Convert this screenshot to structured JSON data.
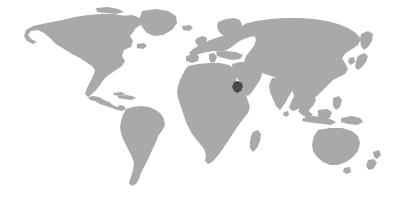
{
  "figure": {
    "kind": "world-locator-map",
    "width": 415,
    "height": 200,
    "projection": "equirectangular"
  },
  "colors": {
    "background": "#ffffff",
    "land": "#a9a9a9",
    "highlight": "#4a4a4a"
  },
  "map": {
    "land_label": "World landmasses",
    "highlight_label": "Highlighted country",
    "highlight_region": "Arabian Peninsula",
    "highlight_center_x": 238,
    "highlight_center_y": 87
  },
  "regions": [
    {
      "name": "north-america",
      "label": "North America"
    },
    {
      "name": "south-america",
      "label": "South America"
    },
    {
      "name": "greenland",
      "label": "Greenland"
    },
    {
      "name": "europe",
      "label": "Europe"
    },
    {
      "name": "africa",
      "label": "Africa"
    },
    {
      "name": "asia",
      "label": "Asia"
    },
    {
      "name": "australia",
      "label": "Australia"
    },
    {
      "name": "new-zealand",
      "label": "New Zealand"
    },
    {
      "name": "japan",
      "label": "Japan"
    },
    {
      "name": "indonesia",
      "label": "Indonesia"
    },
    {
      "name": "madagascar",
      "label": "Madagascar"
    },
    {
      "name": "british-isles",
      "label": "British Isles"
    }
  ]
}
